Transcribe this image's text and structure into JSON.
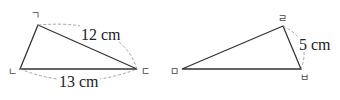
{
  "diagram": {
    "type": "two triangles with labeled vertices and side lengths",
    "triangle_left": {
      "vertices": [
        {
          "label": "ㄱ",
          "x": 38,
          "y": 25
        },
        {
          "label": "ㄴ",
          "x": 20,
          "y": 69
        },
        {
          "label": "ㄷ",
          "x": 137,
          "y": 69
        }
      ],
      "measurements": [
        {
          "side": "ㄱㄷ",
          "text": "12 cm"
        },
        {
          "side": "ㄴㄷ",
          "text": "13 cm"
        }
      ]
    },
    "triangle_right": {
      "vertices": [
        {
          "label": "ㄹ",
          "x": 283,
          "y": 26
        },
        {
          "label": "ㅁ",
          "x": 182,
          "y": 69
        },
        {
          "label": "ㅂ",
          "x": 301,
          "y": 69
        }
      ],
      "measurements": [
        {
          "side": "ㄹㅂ",
          "text": "5 cm"
        }
      ]
    },
    "colors": {
      "line": "#333333",
      "dashed_arc": "#999999",
      "text": "#222222"
    }
  }
}
